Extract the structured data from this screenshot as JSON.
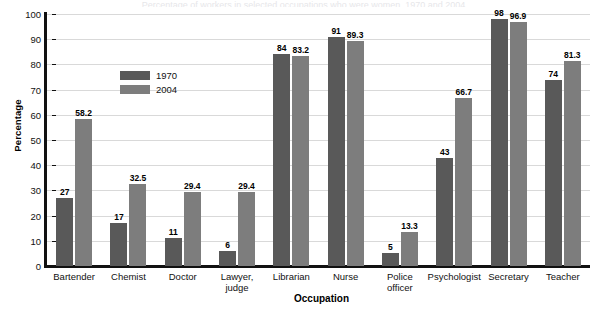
{
  "clipped_title": "Percentage of workers in selected occupations who were women, 1970 and 2004",
  "chart_data": {
    "type": "bar",
    "title": "",
    "xlabel": "Occupation",
    "ylabel": "Percentage",
    "ylim": [
      0,
      100
    ],
    "ytick_step": 10,
    "yticks": [
      0,
      10,
      20,
      30,
      40,
      50,
      60,
      70,
      80,
      90,
      100
    ],
    "grid": true,
    "legend_position": "inside-upper-left",
    "categories": [
      "Bartender",
      "Chemist",
      "Doctor",
      "Lawyer,\njudge",
      "Librarian",
      "Nurse",
      "Police\nofficer",
      "Psychologist",
      "Secretary",
      "Teacher"
    ],
    "category_lines": [
      [
        "Bartender"
      ],
      [
        "Chemist"
      ],
      [
        "Doctor"
      ],
      [
        "Lawyer,",
        "judge"
      ],
      [
        "Librarian"
      ],
      [
        "Nurse"
      ],
      [
        "Police",
        "officer"
      ],
      [
        "Psychologist"
      ],
      [
        "Secretary"
      ],
      [
        "Teacher"
      ]
    ],
    "series": [
      {
        "name": "1970",
        "color": "#595959",
        "values": [
          27,
          17,
          11,
          6,
          84,
          91,
          5,
          43,
          98,
          74
        ],
        "labels": [
          "27",
          "17",
          "11",
          "6",
          "84",
          "91",
          "5",
          "43",
          "98",
          "74"
        ]
      },
      {
        "name": "2004",
        "color": "#7d7d7d",
        "values": [
          58.2,
          32.5,
          29.4,
          29.4,
          83.2,
          89.3,
          13.3,
          66.7,
          96.9,
          81.3
        ],
        "labels": [
          "58.2",
          "32.5",
          "29.4",
          "29.4",
          "83.2",
          "89.3",
          "13.3",
          "66.7",
          "96.9",
          "81.3"
        ]
      }
    ]
  }
}
